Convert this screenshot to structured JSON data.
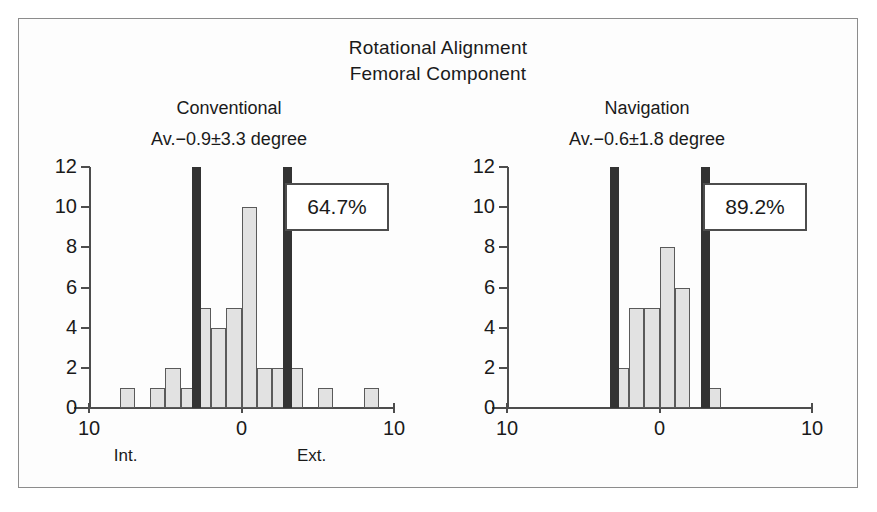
{
  "figure": {
    "title_line1": "Rotational Alignment",
    "title_line2": "Femoral Component",
    "bar_fill_color": "#e2e2e2",
    "bar_edge_color": "#5a5a5a",
    "marker_color": "#333333",
    "axis_color": "#4d4d4d",
    "frame_color": "#8c8c8c"
  },
  "panels": [
    {
      "key": "conventional",
      "heading": "Conventional",
      "subheading": "Av.−0.9±3.3 degree",
      "percent_label": "64.7%",
      "direction_left": "Int.",
      "direction_right": "Ext."
    },
    {
      "key": "navigation",
      "heading": "Navigation",
      "subheading": "Av.−0.6±1.8 degree",
      "percent_label": "89.2%",
      "direction_left": "",
      "direction_right": ""
    }
  ],
  "chart_data": [
    {
      "type": "bar",
      "title": "Conventional",
      "subtitle": "Av.−0.9±3.3 degree",
      "xlabel": "degree (Int. – Ext.)",
      "ylabel": "count",
      "xlim": [
        -10,
        10
      ],
      "ylim": [
        0,
        12
      ],
      "xticks": [
        -10,
        0,
        10
      ],
      "xtick_labels": [
        "10",
        "0",
        "10"
      ],
      "yticks": [
        0,
        2,
        4,
        6,
        8,
        10,
        12
      ],
      "ytick_labels": [
        "0",
        "2",
        "4",
        "6",
        "8",
        "10",
        "12"
      ],
      "grid": false,
      "legend": null,
      "bin_width": 1,
      "bin_centers": [
        -7.5,
        -5.5,
        -4.5,
        -3.5,
        -2.5,
        -1.5,
        -0.5,
        0.5,
        1.5,
        2.5,
        3.5,
        5.5,
        8.5
      ],
      "values": [
        1,
        1,
        2,
        1,
        5,
        4,
        5,
        10,
        2,
        2,
        2,
        1,
        1
      ],
      "annotations": [
        {
          "kind": "threshold-marker",
          "x": -3,
          "label": ""
        },
        {
          "kind": "threshold-marker",
          "x": 3,
          "label": ""
        },
        {
          "kind": "text-box",
          "text": "64.7%"
        }
      ]
    },
    {
      "type": "bar",
      "title": "Navigation",
      "subtitle": "Av.−0.6±1.8 degree",
      "xlabel": "degree (Int. – Ext.)",
      "ylabel": "count",
      "xlim": [
        -10,
        10
      ],
      "ylim": [
        0,
        12
      ],
      "xticks": [
        -10,
        0,
        10
      ],
      "xtick_labels": [
        "10",
        "0",
        "10"
      ],
      "yticks": [
        0,
        2,
        4,
        6,
        8,
        10,
        12
      ],
      "ytick_labels": [
        "0",
        "2",
        "4",
        "6",
        "8",
        "10",
        "12"
      ],
      "grid": false,
      "legend": null,
      "bin_width": 1,
      "bin_centers": [
        -2.5,
        -1.5,
        -0.5,
        0.5,
        1.5,
        3.5
      ],
      "values": [
        2,
        5,
        5,
        8,
        6,
        1
      ],
      "annotations": [
        {
          "kind": "threshold-marker",
          "x": -3,
          "label": ""
        },
        {
          "kind": "threshold-marker",
          "x": 3,
          "label": ""
        },
        {
          "kind": "text-box",
          "text": "89.2%"
        }
      ]
    }
  ]
}
